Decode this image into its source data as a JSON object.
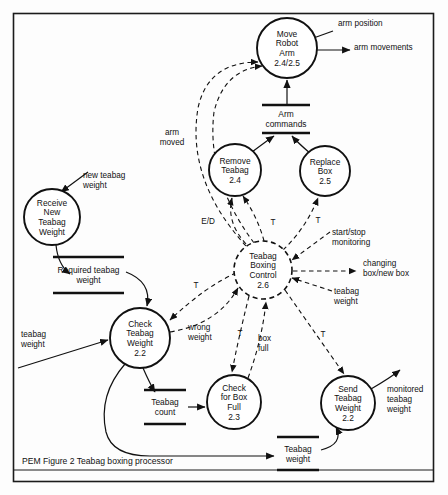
{
  "figure": {
    "caption": "PEM Figure 2   Teabag boxing processor",
    "border_color": "#1b1b1b",
    "ink_color": "#111111",
    "background": "#fdfdfd"
  },
  "processes": [
    {
      "id": "move-robot-arm",
      "lines": [
        "Move",
        "Robot",
        "Arm",
        "2.4/2.5"
      ],
      "cx": 287,
      "cy": 48,
      "r": 30,
      "style": "solid"
    },
    {
      "id": "receive-new-teabag-weight",
      "lines": [
        "Receive",
        "New",
        "Teabag",
        "Weight"
      ],
      "cx": 52,
      "cy": 217,
      "r": 28,
      "style": "solid"
    },
    {
      "id": "remove-teabag",
      "lines": [
        "Remove",
        "Teabag",
        "2.4"
      ],
      "cx": 235,
      "cy": 170,
      "r": 26,
      "style": "solid"
    },
    {
      "id": "replace-box",
      "lines": [
        "Replace",
        "Box",
        "2.5"
      ],
      "cx": 325,
      "cy": 171,
      "r": 25,
      "style": "solid"
    },
    {
      "id": "teabag-boxing-control",
      "lines": [
        "Teabag",
        "Boxing",
        "Control",
        "2.6"
      ],
      "cx": 263,
      "cy": 270,
      "r": 29,
      "style": "dashed"
    },
    {
      "id": "check-teabag-weight",
      "lines": [
        "Check",
        "Teabag",
        "Weight",
        "2.2"
      ],
      "cx": 140,
      "cy": 338,
      "r": 30,
      "style": "solid"
    },
    {
      "id": "check-for-box-full",
      "lines": [
        "Check",
        "for Box",
        "Full",
        "2.3"
      ],
      "cx": 234,
      "cy": 402,
      "r": 27,
      "style": "solid"
    },
    {
      "id": "send-teabag-weight",
      "lines": [
        "Send",
        "Teabag",
        "Weight",
        "2.2"
      ],
      "cx": 348,
      "cy": 403,
      "r": 27,
      "style": "solid"
    }
  ],
  "datastores": [
    {
      "id": "arm-commands",
      "lines": [
        "Arm",
        "commands"
      ],
      "x1": 262,
      "x2": 310,
      "ytop": 105,
      "ybot": 133
    },
    {
      "id": "required-teabag-weight",
      "lines": [
        "Required teabag",
        "weight"
      ],
      "x1": 53,
      "x2": 124,
      "ytop": 257,
      "ybot": 293
    },
    {
      "id": "teabag-count",
      "lines": [
        "Teabag",
        "count"
      ],
      "x1": 144,
      "x2": 186,
      "ytop": 390,
      "ybot": 424
    },
    {
      "id": "teabag-weight-store",
      "lines": [
        "Teabag",
        "weight"
      ],
      "x1": 277,
      "x2": 319,
      "ytop": 437,
      "ybot": 470
    }
  ],
  "flow_labels": [
    {
      "id": "arm-position",
      "lines": [
        "arm position"
      ],
      "x": 338,
      "y": 26,
      "anchor": "start"
    },
    {
      "id": "arm-movements",
      "lines": [
        "arm movements"
      ],
      "x": 354,
      "y": 50,
      "anchor": "start"
    },
    {
      "id": "arm-moved",
      "lines": [
        "arm",
        "moved"
      ],
      "x": 172,
      "y": 135,
      "anchor": "middle"
    },
    {
      "id": "new-teabag-weight",
      "lines": [
        "new teabag",
        "weight"
      ],
      "x": 83,
      "y": 178,
      "anchor": "start"
    },
    {
      "id": "e-over-d",
      "lines": [
        "E/D"
      ],
      "x": 208,
      "y": 224,
      "anchor": "middle"
    },
    {
      "id": "t-remove-teabag",
      "lines": [
        "T"
      ],
      "x": 273,
      "y": 225,
      "anchor": "middle"
    },
    {
      "id": "t-replace-box",
      "lines": [
        "T"
      ],
      "x": 318,
      "y": 223,
      "anchor": "middle"
    },
    {
      "id": "start-stop-monitoring",
      "lines": [
        "start/stop",
        "monitoring"
      ],
      "x": 332,
      "y": 235,
      "anchor": "start"
    },
    {
      "id": "changing-box-new-box",
      "lines": [
        "changing",
        "box/new box"
      ],
      "x": 363,
      "y": 266,
      "anchor": "start"
    },
    {
      "id": "teabag-weight-right",
      "lines": [
        "teabag",
        "weight"
      ],
      "x": 334,
      "y": 294,
      "anchor": "start"
    },
    {
      "id": "t-check-teabag",
      "lines": [
        "T"
      ],
      "x": 196,
      "y": 288,
      "anchor": "middle"
    },
    {
      "id": "wrong-weight",
      "lines": [
        "wrong",
        "weight"
      ],
      "x": 188,
      "y": 330,
      "anchor": "start"
    },
    {
      "id": "teabag-weight-left",
      "lines": [
        "teabag",
        "weight"
      ],
      "x": 21,
      "y": 337,
      "anchor": "start"
    },
    {
      "id": "t-box-full",
      "lines": [
        "T"
      ],
      "x": 240,
      "y": 336,
      "anchor": "middle"
    },
    {
      "id": "box-full",
      "lines": [
        "box",
        "full"
      ],
      "x": 258,
      "y": 341,
      "anchor": "start"
    },
    {
      "id": "t-send-teabag",
      "lines": [
        "T"
      ],
      "x": 323,
      "y": 337,
      "anchor": "middle"
    },
    {
      "id": "monitored-teabag-weight",
      "lines": [
        "monitored",
        "teabag",
        "weight"
      ],
      "x": 387,
      "y": 392,
      "anchor": "start"
    }
  ]
}
